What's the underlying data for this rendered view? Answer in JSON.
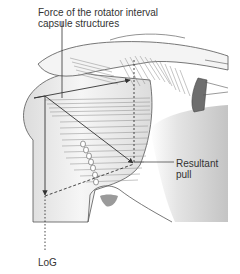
{
  "figure": {
    "type": "anatomical-force-diagram",
    "labels": {
      "force": {
        "line1": "Force of the rotator interval",
        "line2": "capsule structures"
      },
      "resultant": {
        "line1": "Resultant",
        "line2": "pull"
      },
      "log": "LoG"
    },
    "colors": {
      "line": "#333333",
      "bone_fill": "#f2f2f2",
      "shade": "#c8c8c8",
      "muscle": "#8a8a8a",
      "acromion_fill": "#6e6e6e",
      "background": "#ffffff"
    }
  }
}
